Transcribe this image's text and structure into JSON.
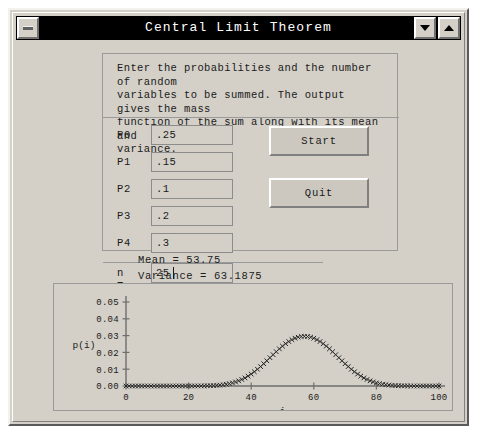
{
  "window": {
    "title": "Central Limit Theorem",
    "menu_button_icon": "window-menu-icon",
    "minimize_icon": "triangle-down-icon",
    "maximize_icon": "triangle-up-icon"
  },
  "form": {
    "instructions": "Enter the probabilities and the number of random\nvariables to be summed. The output gives the mass\nfunction of the sum along with its mean and\nvariance.",
    "fields": [
      {
        "label": "P0",
        "value": ".25"
      },
      {
        "label": "P1",
        "value": ".15"
      },
      {
        "label": "P2",
        "value": ".1"
      },
      {
        "label": "P3",
        "value": ".2"
      },
      {
        "label": "P4",
        "value": ".3"
      }
    ],
    "n_field": {
      "label": "n =",
      "value": "25"
    },
    "start_label": "Start",
    "quit_label": "Quit"
  },
  "results": {
    "mean_line": "Mean = 53.75",
    "variance_line": "Variance = 63.1875"
  },
  "chart_data": {
    "type": "line",
    "title": "",
    "xlabel": "i",
    "ylabel": "p(i)",
    "xlim": [
      0,
      100
    ],
    "ylim": [
      0.0,
      0.05
    ],
    "xticks": [
      0,
      20,
      40,
      60,
      80,
      100
    ],
    "xtick_labels": [
      "0",
      "20",
      "40",
      "60",
      "80",
      "100"
    ],
    "yticks": [
      0.0,
      0.01,
      0.02,
      0.03,
      0.04,
      0.05
    ],
    "ytick_labels": [
      "0.00",
      "0.01",
      "0.02",
      "0.03",
      "0.04",
      "0.05"
    ],
    "grid": false,
    "legend": null,
    "marker": "x",
    "series": [
      {
        "name": "p(i)",
        "x": [
          0,
          1,
          2,
          3,
          4,
          5,
          6,
          7,
          8,
          9,
          10,
          11,
          12,
          13,
          14,
          15,
          16,
          17,
          18,
          19,
          20,
          21,
          22,
          23,
          24,
          25,
          26,
          27,
          28,
          29,
          30,
          31,
          32,
          33,
          34,
          35,
          36,
          37,
          38,
          39,
          40,
          41,
          42,
          43,
          44,
          45,
          46,
          47,
          48,
          49,
          50,
          51,
          52,
          53,
          54,
          55,
          56,
          57,
          58,
          59,
          60,
          61,
          62,
          63,
          64,
          65,
          66,
          67,
          68,
          69,
          70,
          71,
          72,
          73,
          74,
          75,
          76,
          77,
          78,
          79,
          80,
          81,
          82,
          83,
          84,
          85,
          86,
          87,
          88,
          89,
          90,
          91,
          92,
          93,
          94,
          95,
          96,
          97,
          98,
          99,
          100
        ],
        "values": [
          0.0,
          0.0,
          0.0,
          0.0,
          0.0,
          0.0,
          0.0,
          0.0,
          0.0,
          0.0,
          0.0,
          0.0,
          0.0,
          0.0,
          0.0,
          0.0,
          0.0,
          0.0,
          0.0,
          0.0,
          1e-05,
          1e-05,
          2e-05,
          3e-05,
          5e-05,
          8e-05,
          0.00012,
          0.00018,
          0.00027,
          0.00039,
          0.00055,
          0.00077,
          0.00105,
          0.00141,
          0.00186,
          0.00241,
          0.00308,
          0.00388,
          0.00481,
          0.00589,
          0.00711,
          0.00847,
          0.00996,
          0.01156,
          0.01326,
          0.01502,
          0.01683,
          0.01863,
          0.02041,
          0.02211,
          0.02371,
          0.02518,
          0.02647,
          0.02757,
          0.02844,
          0.02907,
          0.02945,
          0.02958,
          0.02945,
          0.02907,
          0.02844,
          0.02757,
          0.02647,
          0.02518,
          0.02371,
          0.02211,
          0.02041,
          0.01863,
          0.01683,
          0.01502,
          0.01326,
          0.01156,
          0.00996,
          0.00847,
          0.00711,
          0.00589,
          0.00481,
          0.00388,
          0.00308,
          0.00241,
          0.00186,
          0.00141,
          0.00105,
          0.00077,
          0.00055,
          0.00039,
          0.00027,
          0.00018,
          0.00012,
          8e-05,
          5e-05,
          3e-05,
          2e-05,
          1e-05,
          1e-05,
          0.0,
          0.0,
          0.0,
          0.0,
          0.0,
          0.0
        ],
        "peak_x": 54,
        "peak_y": 0.0505
      }
    ]
  }
}
